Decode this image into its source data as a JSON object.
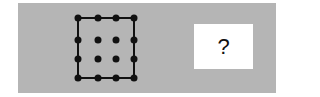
{
  "puzzle": {
    "panel_color": "#b5b5b5",
    "figure": {
      "description": "4x4 dot grid with the outer ring connected by a square outline; inner 2x2 dots unconnected",
      "rows": 4,
      "cols": 4,
      "dot_color": "#111111",
      "line_color": "#111111",
      "x_positions": [
        78,
        98,
        116,
        134
      ],
      "y_positions": [
        18,
        40,
        59,
        78
      ]
    },
    "answer_box": {
      "label": "?"
    }
  }
}
